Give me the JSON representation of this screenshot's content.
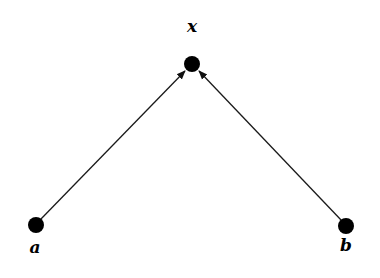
{
  "diagram": {
    "title": "",
    "nodes": [
      {
        "id": "x",
        "label": "x"
      },
      {
        "id": "a",
        "label": "a"
      },
      {
        "id": "b",
        "label": "b"
      }
    ],
    "edges": [
      {
        "from": "a",
        "to": "x",
        "directed": true
      },
      {
        "from": "b",
        "to": "x",
        "directed": true
      }
    ],
    "colors": {
      "node": "#000000",
      "edge": "#1a1a1a",
      "background": "#ffffff"
    }
  }
}
